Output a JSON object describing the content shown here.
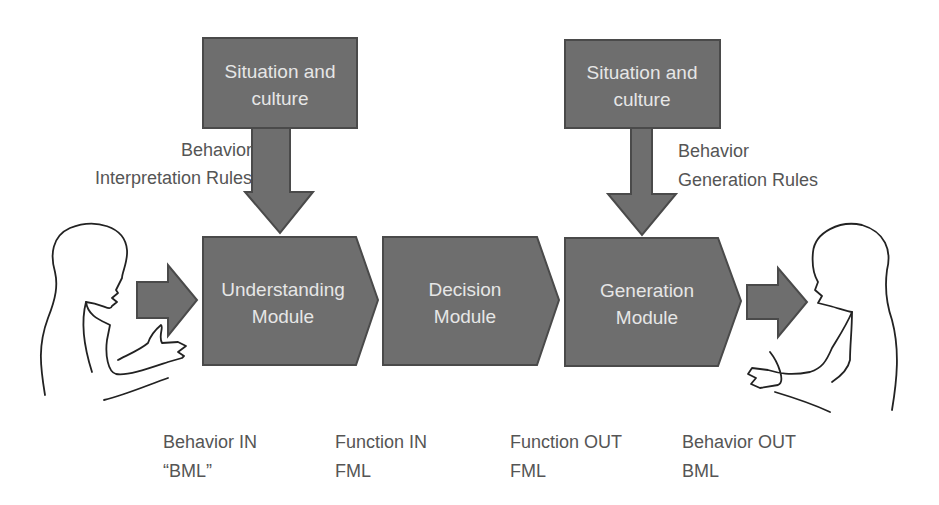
{
  "diagram": {
    "context_boxes": [
      {
        "line1": "Situation and",
        "line2": "culture"
      },
      {
        "line1": "Situation and",
        "line2": "culture"
      }
    ],
    "rule_labels": [
      {
        "line1": "Behavior",
        "line2": "Interpretation Rules"
      },
      {
        "line1": "Behavior",
        "line2": "Generation Rules"
      }
    ],
    "modules": [
      {
        "line1": "Understanding",
        "line2": "Module"
      },
      {
        "line1": "Decision",
        "line2": "Module"
      },
      {
        "line1": "Generation",
        "line2": "Module"
      }
    ],
    "io_labels": [
      {
        "line1": "Behavior IN",
        "line2": "“BML”"
      },
      {
        "line1": "Function IN",
        "line2": "FML"
      },
      {
        "line1": "Function OUT",
        "line2": "FML"
      },
      {
        "line1": "Behavior OUT",
        "line2": "BML"
      }
    ],
    "colors": {
      "shape_fill": "#6e6e6e",
      "shape_stroke": "#4a4a4a",
      "shape_text": "#e6e6e6",
      "label_text": "#555555",
      "outline": "#222222"
    },
    "icons": [
      "human-figure-left",
      "human-figure-right"
    ]
  }
}
